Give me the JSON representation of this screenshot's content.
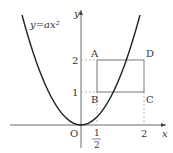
{
  "diagram": {
    "curve_label": "y=ax²",
    "axis_x_label": "x",
    "axis_y_label": "y",
    "origin_label": "O",
    "points": {
      "A": "A",
      "B": "B",
      "C": "C",
      "D": "D"
    },
    "x_ticks": {
      "half_num": "1",
      "half_den": "2",
      "two": "2"
    },
    "y_ticks": {
      "one": "1",
      "two": "2"
    },
    "colors": {
      "curve": "#222222",
      "rect": "#555555",
      "axis": "#444444",
      "dashed": "#888888"
    }
  }
}
